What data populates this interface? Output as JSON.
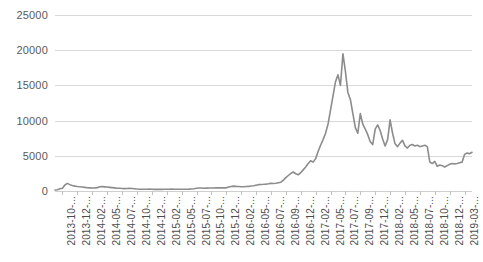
{
  "chart_data": {
    "type": "line",
    "title": "",
    "subtitle": "",
    "xlabel": "",
    "ylabel": "",
    "ylim": [
      0,
      25000
    ],
    "ytick_values": [
      0,
      5000,
      10000,
      15000,
      20000,
      25000
    ],
    "ytick_labels": [
      "0",
      "5000",
      "10000",
      "15000",
      "20000",
      "25000"
    ],
    "grid": true,
    "legend": "none",
    "series_color": "#8c8c8c",
    "gridline_color": "#d9d9d9",
    "label_color": "#5a5a5a",
    "xtick_labels": [
      "2013-10-...",
      "2013-12-...",
      "2014-02-...",
      "2014-05-...",
      "2014-07-...",
      "2014-10-...",
      "2014-12-...",
      "2015-02-...",
      "2015-05-...",
      "2015-07-...",
      "2015-10-...",
      "2015-12-...",
      "2016-02-...",
      "2016-05-...",
      "2016-07-...",
      "2016-09-...",
      "2016-12-...",
      "2017-02-...",
      "2017-05-...",
      "2017-07-...",
      "2017-09-...",
      "2017-12-...",
      "2018-02-...",
      "2018-05-...",
      "2018-07-...",
      "2018-10-...",
      "2018-12-...",
      "2019-03-..."
    ],
    "x": [
      "2013-10",
      "2013-11",
      "2013-12",
      "2014-01",
      "2014-02",
      "2014-03",
      "2014-04",
      "2014-05",
      "2014-06",
      "2014-07",
      "2014-08",
      "2014-09",
      "2014-10",
      "2014-11",
      "2014-12",
      "2015-01",
      "2015-02",
      "2015-03",
      "2015-04",
      "2015-05",
      "2015-06",
      "2015-07",
      "2015-08",
      "2015-09",
      "2015-10",
      "2015-11",
      "2015-12",
      "2016-01",
      "2016-02",
      "2016-03",
      "2016-04",
      "2016-05",
      "2016-06",
      "2016-07",
      "2016-08",
      "2016-09",
      "2016-10",
      "2016-11",
      "2016-12",
      "2017-01",
      "2017-02",
      "2017-03",
      "2017-04",
      "2017-05",
      "2017-06",
      "2017-07",
      "2017-08",
      "2017-09",
      "2017-10",
      "2017-11",
      "2017-12",
      "2018-01",
      "2018-02",
      "2018-03",
      "2018-04",
      "2018-05",
      "2018-06",
      "2018-07",
      "2018-08",
      "2018-09",
      "2018-10",
      "2018-11",
      "2018-12",
      "2019-01",
      "2019-02",
      "2019-03",
      "2019-04"
    ],
    "values": [
      140,
      380,
      1000,
      850,
      620,
      560,
      470,
      440,
      600,
      600,
      510,
      420,
      360,
      370,
      320,
      260,
      240,
      260,
      230,
      235,
      240,
      280,
      240,
      235,
      250,
      350,
      420,
      400,
      420,
      420,
      440,
      450,
      660,
      660,
      580,
      610,
      640,
      740,
      900,
      950,
      1080,
      1060,
      1250,
      2100,
      2600,
      2500,
      3400,
      4200,
      5600,
      8200,
      14500,
      11000,
      9500,
      8500,
      8900,
      8300,
      6700,
      7500,
      6900,
      6500,
      6400,
      4200,
      3600,
      3700,
      3800,
      4000,
      5300
    ],
    "series_detail": [
      140,
      180,
      320,
      400,
      860,
      1080,
      900,
      780,
      690,
      640,
      600,
      560,
      520,
      470,
      450,
      430,
      440,
      460,
      600,
      620,
      590,
      560,
      520,
      480,
      440,
      400,
      380,
      360,
      340,
      360,
      370,
      350,
      320,
      280,
      250,
      240,
      245,
      250,
      260,
      255,
      235,
      230,
      225,
      230,
      240,
      245,
      250,
      260,
      255,
      245,
      240,
      238,
      242,
      250,
      260,
      280,
      320,
      380,
      430,
      420,
      400,
      410,
      420,
      430,
      425,
      440,
      450,
      455,
      445,
      450,
      560,
      650,
      690,
      660,
      640,
      600,
      610,
      630,
      650,
      700,
      740,
      820,
      900,
      930,
      950,
      980,
      1020,
      1080,
      1060,
      1100,
      1180,
      1250,
      1550,
      1900,
      2200,
      2500,
      2700,
      2450,
      2300,
      2600,
      3000,
      3400,
      3900,
      4300,
      4100,
      4600,
      5600,
      6500,
      7300,
      8200,
      9500,
      11500,
      13500,
      15500,
      16500,
      15000,
      19500,
      17000,
      14000,
      13000,
      11000,
      9000,
      8200,
      11000,
      9500,
      8800,
      8000,
      7000,
      6600,
      8800,
      9400,
      8600,
      7400,
      6400,
      7300,
      10100,
      8200,
      6700,
      6300,
      6800,
      7200,
      6400,
      6100,
      6500,
      6600,
      6400,
      6500,
      6300,
      6400,
      6500,
      6300,
      4100,
      3900,
      4200,
      3500,
      3700,
      3600,
      3400,
      3600,
      3800,
      3900,
      3850,
      3900,
      4000,
      4100,
      5200,
      5400,
      5300,
      5500
    ],
    "peak": {
      "value": 19500,
      "x": "2017-12"
    },
    "annotations": []
  }
}
